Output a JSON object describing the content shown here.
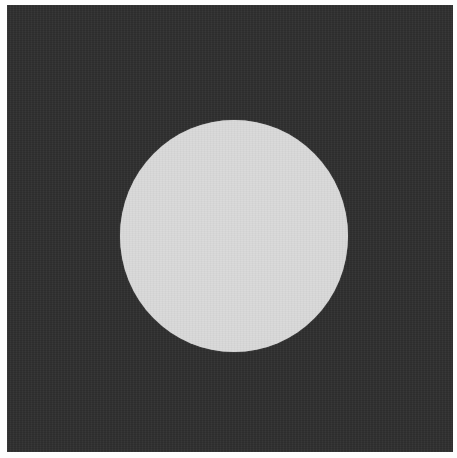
{
  "image": {
    "description": "Dark square with a centered light circular disc",
    "colors": {
      "page_background": "#fdfdfd",
      "square_fill": "#2f2f2f",
      "disc_fill": "#d9d9d9"
    }
  }
}
